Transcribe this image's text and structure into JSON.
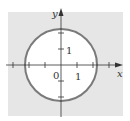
{
  "diagram": {
    "region_fill": "#e6e6e6",
    "disc_fill": "#ffffff",
    "circle_stroke": "#7a7a7a",
    "axis_color": "#333333",
    "labels": {
      "x_axis": "x",
      "y_axis": "y",
      "origin": "0",
      "x_tick": "1",
      "y_tick": "1"
    }
  }
}
